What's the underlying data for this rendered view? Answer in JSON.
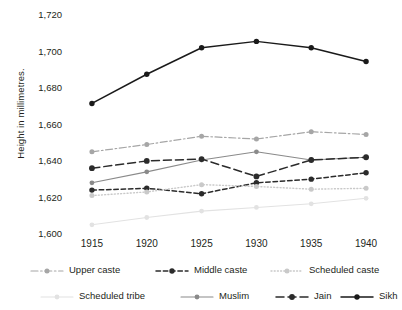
{
  "chart_data": {
    "type": "line",
    "title": "",
    "xlabel": "",
    "ylabel": "Height in millimetres.",
    "categories": [
      "1915",
      "1920",
      "1925",
      "1930",
      "1935",
      "1940"
    ],
    "x": [
      1915,
      1920,
      1925,
      1930,
      1935,
      1940
    ],
    "xlim": [
      1913,
      1942
    ],
    "ylim": [
      1600,
      1720
    ],
    "yticks": [
      1600,
      1620,
      1640,
      1660,
      1680,
      1700,
      1720
    ],
    "ytick_labels": [
      "1,600",
      "1,620",
      "1,640",
      "1,660",
      "1,680",
      "1,700",
      "1,720"
    ],
    "grid": false,
    "legend_position": "bottom",
    "series": [
      {
        "name": "Upper caste",
        "values": [
          1644.5,
          1648.5,
          1653,
          1651.5,
          1655.5,
          1654
        ],
        "color": "#a6a6a6",
        "dash": "dashdot",
        "marker": "circle"
      },
      {
        "name": "Middle caste",
        "values": [
          1623.5,
          1624.5,
          1621.5,
          1627.5,
          1629.5,
          1633
        ],
        "color": "#2b2b2b",
        "dash": "dashed-short",
        "marker": "circle"
      },
      {
        "name": "Scheduled caste",
        "values": [
          1620.5,
          1622.5,
          1626.5,
          1625.5,
          1624,
          1624.5
        ],
        "color": "#c9c9c9",
        "dash": "dotted",
        "marker": "circle"
      },
      {
        "name": "Scheduled tribe",
        "values": [
          1604.5,
          1608.5,
          1612,
          1614,
          1616,
          1619
        ],
        "color": "#e2e2e2",
        "dash": "solid",
        "marker": "circle"
      },
      {
        "name": "Muslim",
        "values": [
          1627.5,
          1633.5,
          1640,
          1644.5,
          1640,
          1641.5
        ],
        "color": "#8a8a8a",
        "dash": "solid",
        "marker": "circle"
      },
      {
        "name": "Jain",
        "values": [
          1635.5,
          1639.5,
          1640.5,
          1631,
          1640,
          1641.5
        ],
        "color": "#2b2b2b",
        "dash": "dashed-long",
        "marker": "circle"
      },
      {
        "name": "Sikh",
        "values": [
          1671,
          1687,
          1701.5,
          1705,
          1701.5,
          1694
        ],
        "color": "#1a1a1a",
        "dash": "solid",
        "marker": "circle"
      }
    ]
  },
  "legend": {
    "rows": [
      [
        "Upper caste",
        "Middle caste",
        "Scheduled caste"
      ],
      [
        "Scheduled tribe",
        "Muslim",
        "Jain",
        "Sikh"
      ]
    ]
  }
}
